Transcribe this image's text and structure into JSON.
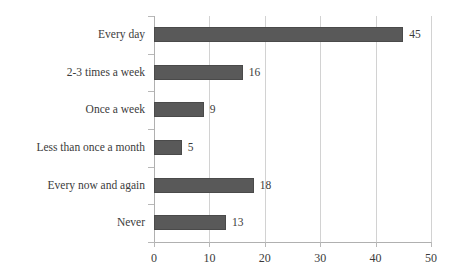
{
  "chart_data": {
    "type": "bar",
    "orientation": "horizontal",
    "title": "",
    "xlabel": "",
    "ylabel": "",
    "categories": [
      "Every day",
      "2-3 times a week",
      "Once a week",
      "Less than once a month",
      "Every now and again",
      "Never"
    ],
    "values": [
      45,
      16,
      9,
      5,
      18,
      13
    ],
    "data_labels": [
      "45",
      "16",
      "9",
      "5",
      "18",
      "13"
    ],
    "xlim": [
      0,
      50
    ],
    "xticks": [
      0,
      10,
      20,
      30,
      40,
      50
    ],
    "xtick_labels": [
      "0",
      "10",
      "20",
      "30",
      "40",
      "50"
    ],
    "grid": "vertical",
    "legend": "none",
    "colors": {
      "bar_fill": "#595959",
      "bar_border": "#4a4a4a",
      "gridline": "#d2d2d2",
      "axis": "#b0b0b0",
      "text": "#3b3b3b",
      "background": "#ffffff"
    }
  }
}
